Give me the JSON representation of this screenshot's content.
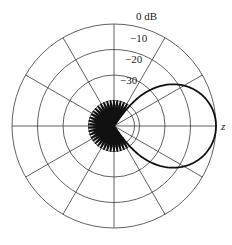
{
  "chart_data": {
    "type": "polar",
    "title": "",
    "radial_axis": {
      "unit": "dB",
      "tick_labels": [
        "0 dB",
        "−10",
        "−20",
        "−30"
      ],
      "tick_values": [
        0,
        -10,
        -20,
        -30,
        -40
      ],
      "range": [
        -40,
        0
      ]
    },
    "angular_axis": {
      "direction_label": "z",
      "zero_direction": "right",
      "spoke_step_deg": 30
    },
    "grid": true,
    "series": [
      {
        "name": "radiation pattern",
        "main_lobe": {
          "peak_db": 0,
          "peak_angle_deg": 0,
          "approx_points_deg_db": [
            [
              0,
              0
            ],
            [
              41,
              -6.7
            ],
            [
              55,
              -40
            ]
          ]
        },
        "side_lobes": {
          "approx_peak_db": -30,
          "count_per_half": 16,
          "region_deg": [
            55,
            180
          ]
        }
      }
    ]
  },
  "labels": {
    "db0": "0 dB",
    "db10": "−10",
    "db20": "−20",
    "db30": "−30",
    "axis": "z"
  },
  "colors": {
    "grid": "#3a3a3a",
    "curve": "#111111",
    "background": "#ffffff"
  }
}
